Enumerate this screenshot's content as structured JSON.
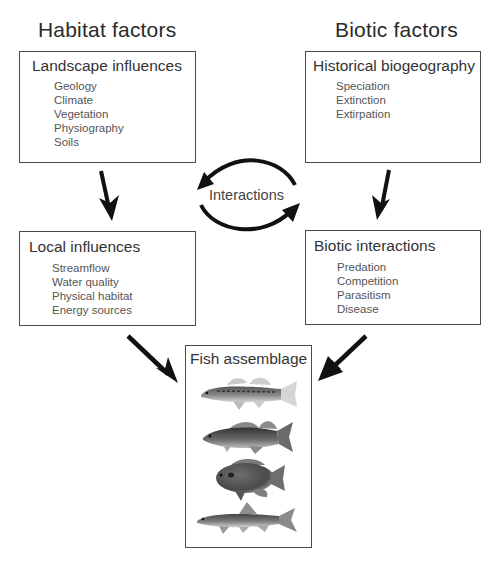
{
  "columns": {
    "left_title": "Habitat factors",
    "right_title": "Biotic factors"
  },
  "boxes": {
    "landscape": {
      "title": "Landscape influences",
      "items": [
        "Geology",
        "Climate",
        "Vegetation",
        "Physiography",
        "Soils"
      ]
    },
    "historical": {
      "title": "Historical biogeography",
      "items": [
        "Speciation",
        "Extinction",
        "Extirpation"
      ]
    },
    "local": {
      "title": "Local influences",
      "items": [
        "Streamflow",
        "Water quality",
        "Physical habitat",
        "Energy sources"
      ]
    },
    "biotic": {
      "title": "Biotic interactions",
      "items": [
        "Predation",
        "Competition",
        "Parasitism",
        "Disease"
      ]
    },
    "fish": {
      "title": "Fish assemblage",
      "images": [
        "darter-fish",
        "bass-fish",
        "sunfish",
        "sucker-fish"
      ]
    }
  },
  "center": {
    "label": "Interactions"
  },
  "colors": {
    "arrow": "#111111",
    "border": "#4a4a4a",
    "text": "#333333"
  }
}
